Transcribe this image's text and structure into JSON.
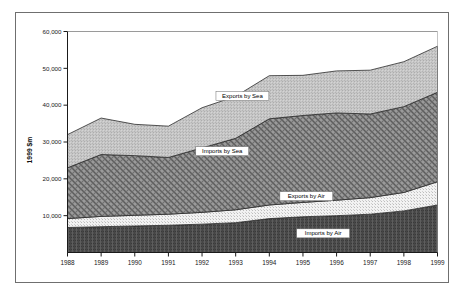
{
  "chart_data": {
    "type": "area",
    "stacked": true,
    "title": "",
    "subtitle": "",
    "xlabel": "",
    "ylabel": "1999 $m",
    "categories": [
      "1988",
      "1989",
      "1990",
      "1991",
      "1992",
      "1993",
      "1994",
      "1995",
      "1996",
      "1997",
      "1998",
      "1999"
    ],
    "x": [
      1988,
      1989,
      1990,
      1991,
      1992,
      1993,
      1994,
      1995,
      1996,
      1997,
      1998,
      1999
    ],
    "ylim": [
      0,
      60000
    ],
    "xlim": [
      1988,
      1999
    ],
    "ytick_labels": [
      "60,000",
      "50,000",
      "40,000",
      "30,000",
      "20,000",
      "10,000"
    ],
    "ytick_values": [
      60000,
      50000,
      40000,
      30000,
      20000,
      10000
    ],
    "xtick_labels": [
      "1988",
      "1989",
      "1990",
      "1991",
      "1992",
      "1993",
      "1994",
      "1995",
      "1996",
      "1997",
      "1998",
      "1999"
    ],
    "grid": false,
    "legend_position": "inline-annotations",
    "series": [
      {
        "name": "Imports by Air",
        "label": "Imports by Air",
        "fill": "#4a4a4a",
        "pattern": "dense-horizontal-dither",
        "values": [
          6800,
          7000,
          7200,
          7400,
          7700,
          8100,
          9200,
          9700,
          10000,
          10400,
          11300,
          12900
        ]
      },
      {
        "name": "Exports by Air",
        "label": "Exports by Air",
        "fill": "#ececec",
        "pattern": "fine-dot",
        "values": [
          2400,
          2800,
          2900,
          3000,
          3200,
          3500,
          3700,
          3900,
          4200,
          4500,
          5000,
          6300
        ]
      },
      {
        "name": "Imports by Sea",
        "label": "Imports by Sea",
        "fill": "#8a8a8a",
        "pattern": "cross-hatch-diamond",
        "values": [
          13800,
          16800,
          16200,
          15400,
          17500,
          19400,
          23400,
          23600,
          23700,
          22700,
          23300,
          24300
        ]
      },
      {
        "name": "Exports by Sea",
        "label": "Exports by Sea",
        "fill": "#bdbdbd",
        "pattern": "light-dither",
        "values": [
          9000,
          9900,
          8500,
          8500,
          10900,
          11400,
          11700,
          10900,
          11400,
          11900,
          12200,
          12500
        ]
      }
    ],
    "stack_tops": {
      "Imports by Air": [
        6800,
        7000,
        7200,
        7400,
        7700,
        8100,
        9200,
        9700,
        10000,
        10400,
        11300,
        12900
      ],
      "Exports by Air": [
        9200,
        9800,
        10100,
        10400,
        10900,
        11600,
        12900,
        13600,
        14200,
        14900,
        16300,
        19200
      ],
      "Imports by Sea": [
        23000,
        26600,
        26300,
        25800,
        28400,
        31000,
        36300,
        37200,
        37900,
        37600,
        39600,
        43500
      ],
      "Exports by Sea": [
        32000,
        36500,
        34800,
        34300,
        39300,
        42400,
        48000,
        48100,
        49300,
        49500,
        51800,
        56000
      ]
    },
    "annotations": [
      {
        "text": "Exports by Sea",
        "x": 1993.2,
        "y": 42500
      },
      {
        "text": "Imports by Sea",
        "x": 1992.6,
        "y": 27500
      },
      {
        "text": "Exports by Air",
        "x": 1995.1,
        "y": 15300
      },
      {
        "text": "Imports by Air",
        "x": 1995.6,
        "y": 5200
      }
    ]
  },
  "colors": {
    "frame": "#6f6f6f",
    "axis": "#1a1a1a",
    "background": "#ffffff",
    "imports_by_air": "#4a4a4a",
    "exports_by_air": "#ececec",
    "imports_by_sea": "#8a8a8a",
    "exports_by_sea": "#bdbdbd"
  }
}
